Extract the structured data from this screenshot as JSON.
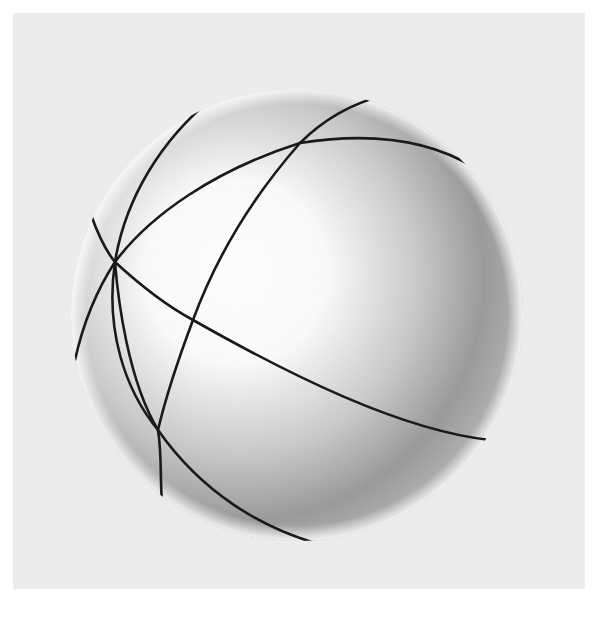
{
  "figure": {
    "colors": {
      "page_background": "#ffffff",
      "panel_background": "#ececec",
      "sphere_highlight": "#ffffff",
      "sphere_shadow": "#8a8a8a",
      "arc_stroke": "#1a1a1a"
    },
    "sphere": {
      "cx": 297,
      "cy": 315,
      "r": 226
    },
    "arcs": [
      {
        "id": "arc-1",
        "d": "M 215 96 C 160 140, 125 200, 115 262 C 105 330, 125 390, 158 430 C 162 455, 160 480, 162 502"
      },
      {
        "id": "arc-2",
        "d": "M 90 212 C 98 235, 105 250, 115 262 C 118 300, 128 380, 158 430 C 200 490, 260 530, 330 547"
      },
      {
        "id": "arc-3",
        "d": "M 115 262 C 150 215, 215 170, 300 143 C 370 132, 430 140, 475 168"
      },
      {
        "id": "arc-4",
        "d": "M 385 95 C 345 105, 318 125, 300 143 C 250 200, 215 260, 193 320 C 178 360, 165 400, 158 430"
      },
      {
        "id": "arc-5",
        "d": "M 115 262 C 140 285, 165 305, 193 320 C 290 375, 400 430, 490 440"
      },
      {
        "id": "arc-6",
        "d": "M 115 262 C 100 285, 85 315, 75 360"
      }
    ]
  }
}
